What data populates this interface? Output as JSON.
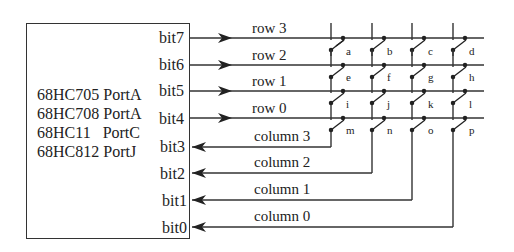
{
  "device": {
    "chips": [
      "68HC705 PortA",
      "68HC708 PortA",
      "68HC11   PortC",
      "68HC812 PortJ"
    ],
    "bits": [
      "bit7",
      "bit6",
      "bit5",
      "bit4",
      "bit3",
      "bit2",
      "bit1",
      "bit0"
    ]
  },
  "rows": [
    {
      "label": "row 3",
      "bit": "bit7",
      "direction": "output"
    },
    {
      "label": "row 2",
      "bit": "bit6",
      "direction": "output"
    },
    {
      "label": "row 1",
      "bit": "bit5",
      "direction": "output"
    },
    {
      "label": "row 0",
      "bit": "bit4",
      "direction": "output"
    }
  ],
  "columns": [
    {
      "label": "column 3",
      "bit": "bit3",
      "direction": "input"
    },
    {
      "label": "column 2",
      "bit": "bit2",
      "direction": "input"
    },
    {
      "label": "column 1",
      "bit": "bit1",
      "direction": "input"
    },
    {
      "label": "column 0",
      "bit": "bit0",
      "direction": "input"
    }
  ],
  "keys": [
    [
      "a",
      "b",
      "c",
      "d"
    ],
    [
      "e",
      "f",
      "g",
      "h"
    ],
    [
      "i",
      "j",
      "k",
      "l"
    ],
    [
      "m",
      "n",
      "o",
      "p"
    ]
  ],
  "colors": {
    "line": "#333333",
    "text": "#222222",
    "background": "#ffffff"
  }
}
